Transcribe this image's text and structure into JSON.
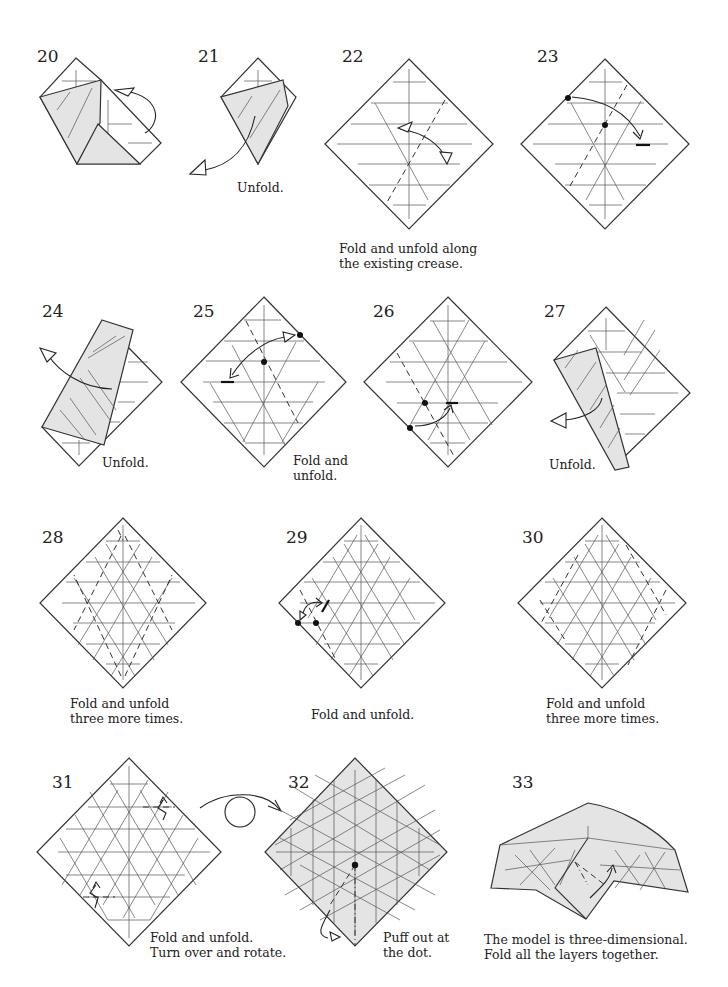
{
  "page": {
    "fill_color": "#e4e4e4",
    "line_color": "#333333"
  },
  "steps": [
    {
      "number": "20",
      "caption": ""
    },
    {
      "number": "21",
      "caption": "Unfold."
    },
    {
      "number": "22",
      "caption": "Fold and unfold along\nthe existing crease."
    },
    {
      "number": "23",
      "caption": ""
    },
    {
      "number": "24",
      "caption": "Unfold."
    },
    {
      "number": "25",
      "caption": "Fold and\nunfold."
    },
    {
      "number": "26",
      "caption": ""
    },
    {
      "number": "27",
      "caption": "Unfold."
    },
    {
      "number": "28",
      "caption": "Fold and unfold\nthree more times."
    },
    {
      "number": "29",
      "caption": "Fold and unfold."
    },
    {
      "number": "30",
      "caption": "Fold and unfold\nthree more times."
    },
    {
      "number": "31",
      "caption": "Fold and unfold.\nTurn over and rotate."
    },
    {
      "number": "32",
      "caption": "Puff out at\nthe dot."
    },
    {
      "number": "33",
      "caption": "The model is three-dimensional.\nFold all the layers together."
    }
  ],
  "icons": {
    "valley_fold": "dashed-line",
    "mountain_fold": "dash-dot-line",
    "unfold_arrow": "hollow-arrowhead",
    "turn_over": "loop-arrow",
    "reference_point": "black-dot"
  }
}
